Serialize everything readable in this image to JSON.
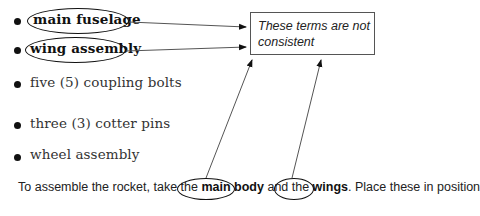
{
  "list": {
    "items": [
      {
        "label": "main fuselage",
        "highlighted": true
      },
      {
        "label": "wing assembly",
        "highlighted": true
      },
      {
        "label": "five (5) coupling bolts",
        "highlighted": false
      },
      {
        "label": "three (3) cotter pins",
        "highlighted": false
      },
      {
        "label": "wheel assembly",
        "highlighted": false
      }
    ]
  },
  "callout": {
    "text": "These terms are not consistent"
  },
  "paragraph": {
    "prefix": "To assemble the rocket, take the ",
    "term1": "main body",
    "middle": " and the ",
    "term2": "wings",
    "suffix": ". Place these in position"
  },
  "colors": {
    "ink": "#111111",
    "body_text": "#333333",
    "box_border": "#555555"
  }
}
